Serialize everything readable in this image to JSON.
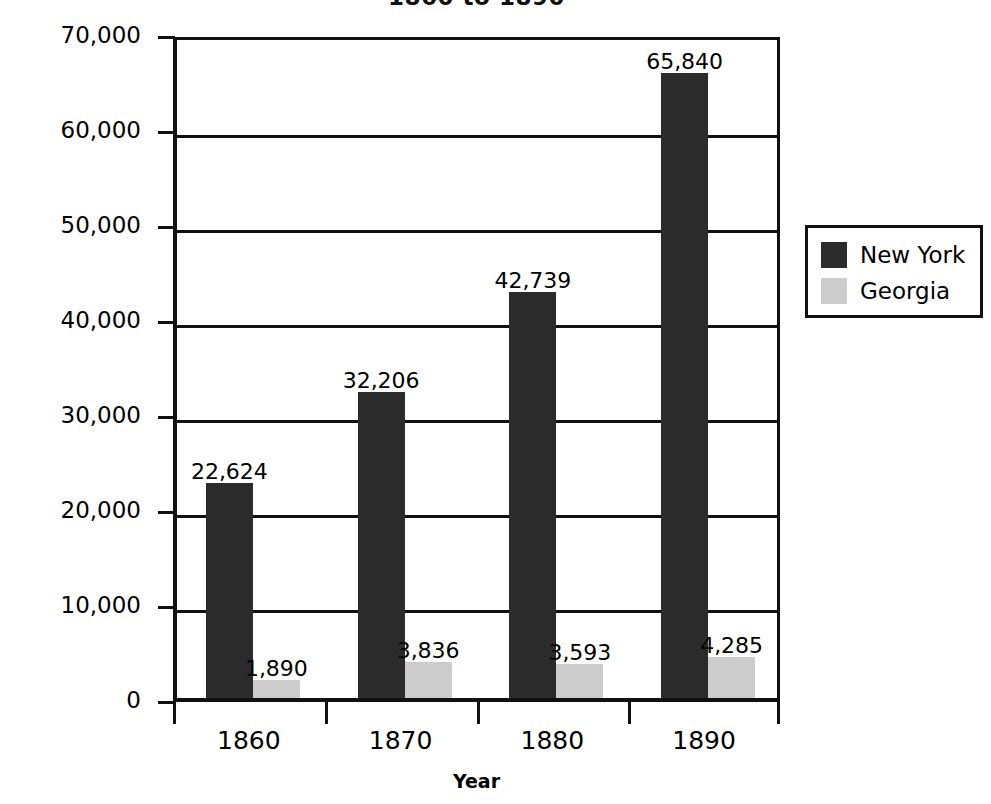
{
  "chart_data": {
    "type": "bar",
    "title": "1860 to 1890",
    "xlabel": "Year",
    "ylabel": "Number of Factories",
    "categories": [
      "1860",
      "1870",
      "1880",
      "1890"
    ],
    "series": [
      {
        "name": "New York",
        "color": "#2b2b2b",
        "values": [
          22624,
          32206,
          42739,
          65840
        ],
        "value_labels": [
          "22,624",
          "32,206",
          "42,739",
          "65,840"
        ]
      },
      {
        "name": "Georgia",
        "color": "#cccccc",
        "values": [
          1890,
          3836,
          3593,
          4285
        ],
        "value_labels": [
          "1,890",
          "3,836",
          "3,593",
          "4,285"
        ]
      }
    ],
    "ylim": [
      0,
      70000
    ],
    "ytick_values": [
      0,
      10000,
      20000,
      30000,
      40000,
      50000,
      60000,
      70000
    ],
    "ytick_labels": [
      "0",
      "10,000",
      "20,000",
      "30,000",
      "40,000",
      "50,000",
      "60,000",
      "70,000"
    ],
    "grid": true,
    "grid_axis": "y",
    "legend_position": "right",
    "legend_entries": [
      "New York",
      "Georgia"
    ],
    "data_labels_shown": true,
    "background_color": "#ffffff",
    "axis_color": "#111111"
  }
}
